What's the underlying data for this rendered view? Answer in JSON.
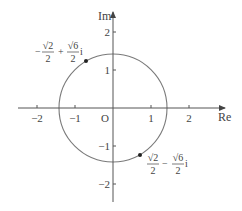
{
  "diagram": {
    "axes": {
      "x_label": "Re",
      "y_label": "Im",
      "origin_label": "O",
      "x_ticks": [
        "−2",
        "−1",
        "1",
        "2"
      ],
      "y_ticks": [
        "2",
        "1",
        "−1",
        "−2"
      ]
    },
    "circle": {
      "center": [
        0,
        0
      ],
      "radius": "√2"
    },
    "points": [
      {
        "coords": [
          -0.7071,
          1.2247
        ],
        "label": {
          "a_num": "√2",
          "a_den": "2",
          "a_sign": "−",
          "op": "+",
          "b_num": "√6",
          "b_den": "2",
          "unit": "i"
        }
      },
      {
        "coords": [
          0.7071,
          -1.2247
        ],
        "label": {
          "a_num": "√2",
          "a_den": "2",
          "a_sign": "",
          "op": "−",
          "b_num": "√6",
          "b_den": "2",
          "unit": "i"
        }
      }
    ],
    "colors": {
      "axis": "#555555",
      "circle": "#7a7a7a",
      "point": "#222222",
      "text": "#444444"
    }
  }
}
